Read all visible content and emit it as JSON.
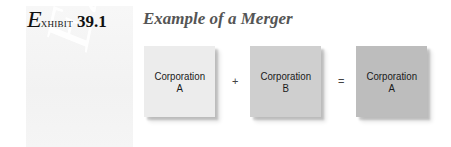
{
  "header": {
    "exhibit_script_letter": "E",
    "exhibit_word": "xhibit",
    "exhibit_number": "39.1",
    "title": "Example of a Merger"
  },
  "watermark": {
    "text": "Exh"
  },
  "diagram": {
    "boxes": [
      {
        "line1": "Corporation",
        "line2": "A",
        "color": "#ececec"
      },
      {
        "line1": "Corporation",
        "line2": "B",
        "color": "#cfcfcf"
      },
      {
        "line1": "Corporation",
        "line2": "A",
        "color": "#bdbdbd"
      }
    ],
    "operators": {
      "plus": "+",
      "equals": "="
    }
  }
}
